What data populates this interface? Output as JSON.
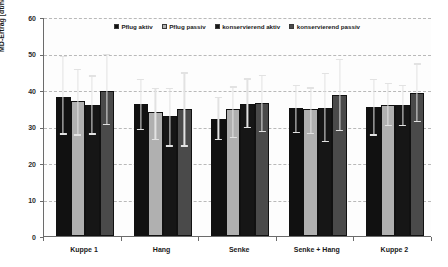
{
  "chart_data": {
    "type": "bar",
    "title": "",
    "xlabel": "",
    "ylabel": "MD-Ertrag [dt/ha]",
    "ylim": [
      0,
      60
    ],
    "ytick_values": [
      0,
      10,
      20,
      30,
      40,
      50,
      60
    ],
    "ytick_labels": [
      "0",
      "10",
      "20",
      "30",
      "40",
      "50",
      "60"
    ],
    "grid": true,
    "grid_style": "dashed-horizontal",
    "legend_position": "top-center",
    "categories": [
      "Kuppe 1",
      "Hang",
      "Senke",
      "Senke + Hang",
      "Kuppe 2"
    ],
    "series": [
      {
        "name": "Pflug aktiv",
        "color": "#111111",
        "values": [
          38.0,
          36.2,
          32.1,
          35.0,
          35.4
        ],
        "err_low": [
          27.8,
          29.0,
          26.2,
          28.1,
          27.5
        ],
        "err_high": [
          49.4,
          43.0,
          38.2,
          41.5,
          43.0
        ]
      },
      {
        "name": "Pflug passiv",
        "color": "#b0b0b0",
        "values": [
          36.9,
          33.9,
          34.9,
          34.7,
          35.8
        ],
        "err_low": [
          27.5,
          26.2,
          26.9,
          27.9,
          30.1
        ],
        "err_high": [
          45.8,
          40.6,
          41.0,
          40.7,
          41.9
        ]
      },
      {
        "name": "konservierend aktiv",
        "color": "#161616",
        "values": [
          35.9,
          32.8,
          36.2,
          35.1,
          35.9
        ],
        "err_low": [
          27.8,
          24.5,
          29.5,
          25.8,
          30.2
        ],
        "err_high": [
          44.0,
          40.5,
          43.2,
          44.7,
          41.4
        ]
      },
      {
        "name": "konservierend passiv",
        "color": "#4a4a4a",
        "values": [
          39.7,
          34.7,
          36.5,
          38.7,
          39.3
        ],
        "err_low": [
          30.4,
          24.5,
          28.4,
          28.8,
          31.2
        ],
        "err_high": [
          49.8,
          44.8,
          44.2,
          48.6,
          47.3
        ]
      }
    ]
  },
  "legend": {
    "items": [
      {
        "label": "Pflug aktiv"
      },
      {
        "label": "Pflug passiv"
      },
      {
        "label": "konservierend aktiv"
      },
      {
        "label": "konservierend passiv"
      }
    ]
  },
  "axes": {
    "y_title": "MD-Ertrag [dt/ha]"
  }
}
